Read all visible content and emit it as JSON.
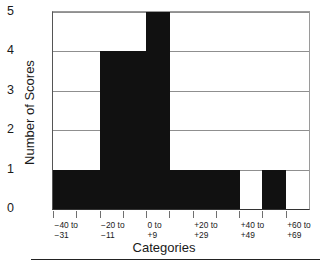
{
  "chart_data": {
    "type": "bar",
    "title": "",
    "subtitle": "",
    "xlabel": "Categories",
    "ylabel": "Number of Scores",
    "categories": [
      "-40 to\n-31",
      "-30 to\n-21",
      "-20 to\n-11",
      "-10 to\n-1",
      "0 to\n+9",
      "+10 to\n+19",
      "+20 to\n+29",
      "+30 to\n+39",
      "+40 to\n+49",
      "+50 to\n+59",
      "+60 to\n+69"
    ],
    "values": [
      1,
      1,
      4,
      4,
      5,
      1,
      1,
      1,
      0,
      1,
      0
    ],
    "ylim": [
      0,
      5
    ],
    "yticks": [
      "0",
      "1",
      "2",
      "3",
      "4",
      "5"
    ],
    "ytick_values": [
      0,
      1,
      2,
      3,
      4,
      5
    ],
    "xtick_labels_visible": [
      "-40 to\n-31",
      "-20 to\n-11",
      "0 to\n+9",
      "+20 to\n+29",
      "+40 to\n+49",
      "+60 to\n+69"
    ],
    "grid": true,
    "grid_axis": "y",
    "legend": null,
    "bar_color": "#111111",
    "grid_color": "#8f8f8f",
    "axis_color": "#333333",
    "background": "#ffffff"
  }
}
